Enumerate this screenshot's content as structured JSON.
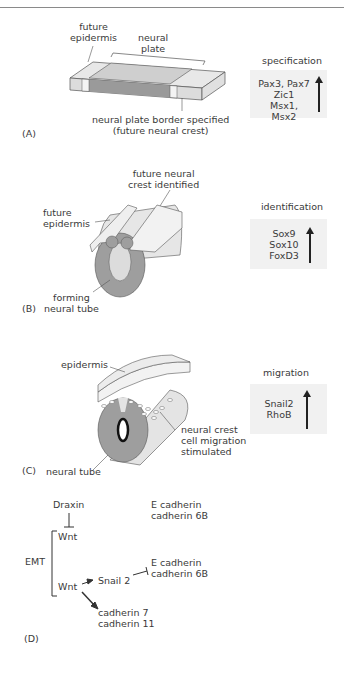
{
  "panels": {
    "A": {
      "label": "(A)",
      "annotations": {
        "future_epidermis": [
          "future",
          "epidermis"
        ],
        "neural_plate": [
          "neural",
          "plate"
        ],
        "border": [
          "neural plate border specified",
          "(future neural crest)"
        ]
      },
      "stage_box": {
        "title": "specification",
        "genes": [
          "Pax3, Pax7",
          "Zic1",
          "Msx1, Msx2"
        ]
      }
    },
    "B": {
      "label": "(B)",
      "annotations": {
        "future_neural_crest": [
          "future neural",
          "crest identified"
        ],
        "future_epidermis": [
          "future",
          "epidermis"
        ],
        "forming_neural_tube": [
          "forming",
          "neural tube"
        ]
      },
      "stage_box": {
        "title": "identification",
        "genes": [
          "Sox9",
          "Sox10",
          "FoxD3"
        ]
      }
    },
    "C": {
      "label": "(C)",
      "annotations": {
        "epidermis": "epidermis",
        "migration": [
          "neural crest",
          "cell migration",
          "stimulated"
        ],
        "neural_tube": "neural tube"
      },
      "stage_box": {
        "title": "migration",
        "genes": [
          "Snail2",
          "RhoB"
        ]
      }
    },
    "D": {
      "label": "(D)",
      "nodes": {
        "draxin": "Draxin",
        "wnt_top": "Wnt",
        "wnt_bottom": "Wnt",
        "emt": "EMT",
        "snail2": "Snail 2",
        "ecad_top": [
          "E cadherin",
          "cadherin 6B"
        ],
        "ecad_mid": [
          "E cadherin",
          "cadherin 6B"
        ],
        "cad7_11": [
          "cadherin 7",
          "cadherin 11"
        ]
      }
    }
  },
  "colors": {
    "light_gray": "#e3e3e3",
    "mid_gray": "#c8c8c8",
    "dark_gray": "#9a9a9a",
    "box_bg": "#f1f1f1",
    "line": "#444444"
  }
}
